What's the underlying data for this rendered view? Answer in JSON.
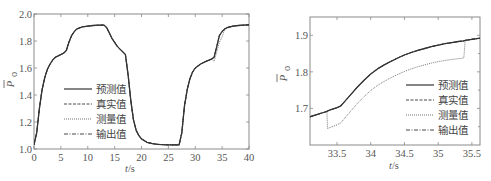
{
  "chart_data": [
    {
      "type": "line",
      "title": "",
      "xlabel": "t/s",
      "ylabel": "P̄o",
      "xlim": [
        0,
        40
      ],
      "ylim": [
        1.0,
        2.0
      ],
      "xticks": [
        "0",
        "5",
        "10",
        "15",
        "20",
        "25",
        "30",
        "35",
        "40"
      ],
      "yticks": [
        "1.0",
        "1.2",
        "1.4",
        "1.6",
        "1.8",
        "2.0"
      ],
      "grid": false,
      "legend_position": "center-left",
      "legend": [
        "预测值",
        "真实值",
        "测量值",
        "输出值"
      ],
      "x": [
        0,
        0.5,
        1,
        1.5,
        2,
        2.5,
        3,
        3.5,
        4,
        4.5,
        5,
        5.5,
        6,
        6.5,
        7,
        7.5,
        8,
        9,
        10,
        11,
        12,
        13,
        13.5,
        14,
        14.5,
        15,
        15.5,
        16,
        16.5,
        17,
        17.5,
        18,
        18.5,
        19,
        19.5,
        20,
        21,
        22,
        23,
        24,
        25,
        26,
        27,
        27.5,
        28,
        28.5,
        29,
        29.5,
        30,
        31,
        32,
        33,
        33.5,
        34,
        34.5,
        35,
        35.5,
        36,
        37,
        38,
        39,
        40
      ],
      "series": [
        {
          "name": "预测值",
          "style": "solid",
          "values": [
            1.03,
            1.12,
            1.3,
            1.44,
            1.53,
            1.59,
            1.63,
            1.66,
            1.68,
            1.69,
            1.7,
            1.71,
            1.73,
            1.79,
            1.84,
            1.87,
            1.89,
            1.905,
            1.91,
            1.915,
            1.917,
            1.918,
            1.9,
            1.86,
            1.82,
            1.79,
            1.76,
            1.74,
            1.72,
            1.7,
            1.55,
            1.36,
            1.22,
            1.14,
            1.1,
            1.075,
            1.05,
            1.04,
            1.035,
            1.032,
            1.03,
            1.03,
            1.03,
            1.12,
            1.32,
            1.44,
            1.52,
            1.57,
            1.6,
            1.63,
            1.65,
            1.665,
            1.68,
            1.76,
            1.84,
            1.87,
            1.89,
            1.9,
            1.91,
            1.915,
            1.918,
            1.92
          ]
        },
        {
          "name": "真实值",
          "style": "dashed",
          "values": [
            1.03,
            1.12,
            1.3,
            1.44,
            1.53,
            1.59,
            1.63,
            1.66,
            1.68,
            1.69,
            1.7,
            1.71,
            1.73,
            1.79,
            1.84,
            1.87,
            1.89,
            1.905,
            1.91,
            1.915,
            1.917,
            1.918,
            1.9,
            1.86,
            1.82,
            1.79,
            1.76,
            1.74,
            1.72,
            1.7,
            1.55,
            1.36,
            1.22,
            1.14,
            1.1,
            1.075,
            1.05,
            1.04,
            1.035,
            1.032,
            1.03,
            1.03,
            1.03,
            1.12,
            1.32,
            1.44,
            1.52,
            1.57,
            1.6,
            1.63,
            1.65,
            1.665,
            1.68,
            1.76,
            1.84,
            1.87,
            1.89,
            1.9,
            1.91,
            1.915,
            1.918,
            1.92
          ]
        },
        {
          "name": "测量值",
          "style": "dotted",
          "values": [
            1.03,
            1.12,
            1.3,
            1.44,
            1.53,
            1.59,
            1.63,
            1.66,
            1.68,
            1.69,
            1.7,
            1.71,
            1.73,
            1.79,
            1.84,
            1.87,
            1.89,
            1.905,
            1.91,
            1.915,
            1.917,
            1.918,
            1.9,
            1.86,
            1.82,
            1.79,
            1.76,
            1.74,
            1.72,
            1.7,
            1.55,
            1.36,
            1.22,
            1.14,
            1.1,
            1.075,
            1.05,
            1.04,
            1.035,
            1.032,
            1.03,
            1.03,
            1.03,
            1.12,
            1.32,
            1.44,
            1.52,
            1.57,
            1.6,
            1.63,
            1.65,
            1.665,
            1.65,
            1.72,
            1.79,
            1.83,
            1.89,
            1.9,
            1.91,
            1.915,
            1.918,
            1.92
          ]
        },
        {
          "name": "输出值",
          "style": "dash-dot",
          "values": [
            1.03,
            1.12,
            1.3,
            1.44,
            1.53,
            1.59,
            1.63,
            1.66,
            1.68,
            1.69,
            1.7,
            1.71,
            1.73,
            1.79,
            1.84,
            1.87,
            1.89,
            1.905,
            1.91,
            1.915,
            1.917,
            1.918,
            1.9,
            1.86,
            1.82,
            1.79,
            1.76,
            1.74,
            1.72,
            1.7,
            1.55,
            1.36,
            1.22,
            1.14,
            1.1,
            1.075,
            1.05,
            1.04,
            1.035,
            1.032,
            1.03,
            1.03,
            1.03,
            1.12,
            1.32,
            1.44,
            1.52,
            1.57,
            1.6,
            1.63,
            1.65,
            1.665,
            1.68,
            1.76,
            1.84,
            1.87,
            1.89,
            1.9,
            1.91,
            1.915,
            1.918,
            1.92
          ]
        }
      ]
    },
    {
      "type": "line",
      "title": "",
      "xlabel": "t/s",
      "ylabel": "P̄o",
      "xlim": [
        33.1,
        35.62
      ],
      "ylim": [
        1.6,
        1.95
      ],
      "xticks": [
        "33.5",
        "34",
        "34.5",
        "35",
        "35.5"
      ],
      "yticks": [
        "1.7",
        "1.8",
        "1.9"
      ],
      "grid": false,
      "legend_position": "lower-right",
      "legend": [
        "预测值",
        "真实值",
        "测量值",
        "输出值"
      ],
      "x": [
        33.1,
        33.2,
        33.3,
        33.35,
        33.36,
        33.4,
        33.5,
        33.55,
        33.6,
        33.7,
        33.8,
        33.9,
        34.0,
        34.1,
        34.2,
        34.3,
        34.4,
        34.5,
        34.6,
        34.7,
        34.8,
        34.9,
        35.0,
        35.1,
        35.2,
        35.3,
        35.38,
        35.4,
        35.5,
        35.62
      ],
      "series": [
        {
          "name": "预测值",
          "style": "solid",
          "values": [
            1.677,
            1.683,
            1.689,
            1.692,
            1.693,
            1.696,
            1.702,
            1.706,
            1.716,
            1.737,
            1.758,
            1.777,
            1.794,
            1.808,
            1.819,
            1.829,
            1.838,
            1.846,
            1.853,
            1.859,
            1.864,
            1.869,
            1.873,
            1.877,
            1.88,
            1.883,
            1.885,
            1.886,
            1.889,
            1.892
          ]
        },
        {
          "name": "真实值",
          "style": "dashed",
          "values": [
            1.677,
            1.683,
            1.689,
            1.692,
            1.693,
            1.696,
            1.702,
            1.706,
            1.716,
            1.737,
            1.758,
            1.777,
            1.794,
            1.808,
            1.819,
            1.829,
            1.838,
            1.846,
            1.853,
            1.859,
            1.864,
            1.869,
            1.873,
            1.877,
            1.88,
            1.883,
            1.885,
            1.886,
            1.889,
            1.892
          ]
        },
        {
          "name": "测量值",
          "style": "dotted",
          "values": [
            1.677,
            1.683,
            1.689,
            1.692,
            1.645,
            1.648,
            1.655,
            1.66,
            1.67,
            1.692,
            1.713,
            1.732,
            1.749,
            1.763,
            1.774,
            1.784,
            1.793,
            1.801,
            1.808,
            1.814,
            1.819,
            1.824,
            1.828,
            1.831,
            1.834,
            1.836,
            1.838,
            1.886,
            1.889,
            1.892
          ]
        },
        {
          "name": "输出值",
          "style": "dash-dot",
          "values": [
            1.677,
            1.683,
            1.689,
            1.692,
            1.693,
            1.696,
            1.702,
            1.706,
            1.716,
            1.737,
            1.758,
            1.777,
            1.794,
            1.808,
            1.819,
            1.829,
            1.838,
            1.846,
            1.853,
            1.859,
            1.864,
            1.869,
            1.873,
            1.877,
            1.88,
            1.883,
            1.885,
            1.886,
            1.889,
            1.892
          ]
        }
      ]
    }
  ],
  "plots": [
    {
      "frame": {
        "left": 34,
        "top": 14,
        "right": 249,
        "bottom": 149
      },
      "ylabel_pos": {
        "x": 14,
        "y": 84
      },
      "xlabel_pos": {
        "x": 130,
        "y": 172
      },
      "legend": {
        "x": 64,
        "y": 89,
        "dy": 15,
        "line_len": 28
      }
    },
    {
      "frame": {
        "left": 310,
        "top": 17,
        "right": 480,
        "bottom": 145
      },
      "ylabel_pos": {
        "x": 287,
        "y": 78
      },
      "xlabel_pos": {
        "x": 394,
        "y": 169
      },
      "legend": {
        "x": 406,
        "y": 85,
        "dy": 15,
        "line_len": 28
      }
    }
  ],
  "colors": {
    "line": "#333333",
    "frame": "#8a8a8a",
    "measured": "#666666"
  }
}
